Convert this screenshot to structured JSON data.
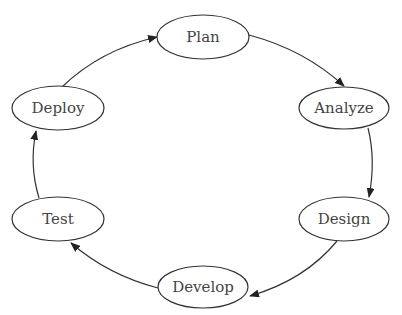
{
  "diagram": {
    "type": "cycle",
    "colors": {
      "stroke": "#333333",
      "text": "#444444",
      "background": "#ffffff"
    },
    "nodes": [
      {
        "id": "plan",
        "label": "Plan",
        "cx": 203,
        "cy": 37
      },
      {
        "id": "analyze",
        "label": "Analyze",
        "cx": 344,
        "cy": 108
      },
      {
        "id": "design",
        "label": "Design",
        "cx": 344,
        "cy": 219
      },
      {
        "id": "develop",
        "label": "Develop",
        "cx": 203,
        "cy": 287
      },
      {
        "id": "test",
        "label": "Test",
        "cx": 58,
        "cy": 219
      },
      {
        "id": "deploy",
        "label": "Deploy",
        "cx": 58,
        "cy": 108
      }
    ],
    "edges": [
      {
        "from": "Plan",
        "to": "Analyze"
      },
      {
        "from": "Analyze",
        "to": "Design"
      },
      {
        "from": "Design",
        "to": "Develop"
      },
      {
        "from": "Develop",
        "to": "Test"
      },
      {
        "from": "Test",
        "to": "Deploy"
      },
      {
        "from": "Deploy",
        "to": "Plan"
      }
    ]
  }
}
